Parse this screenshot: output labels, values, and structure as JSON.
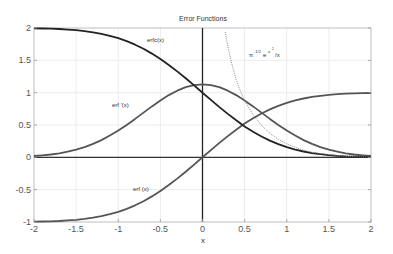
{
  "chart_data": {
    "type": "line",
    "title": "Error Functions",
    "xlabel": "x",
    "ylabel": "",
    "xlim": [
      -2,
      2
    ],
    "ylim": [
      -1,
      2
    ],
    "grid": true,
    "x_ticks": [
      "-2",
      "-1.5",
      "-1",
      "-0.5",
      "0",
      "0.5",
      "1",
      "1.5",
      "2"
    ],
    "x_tick_values": [
      -2,
      -1.5,
      -1,
      -0.5,
      0,
      0.5,
      1,
      1.5,
      2
    ],
    "y_ticks": [
      "-1",
      "-0.5",
      "0",
      "0.5",
      "1",
      "1.5",
      "2"
    ],
    "y_tick_values": [
      -1,
      -0.5,
      0,
      0.5,
      1,
      1.5,
      2
    ],
    "x": [
      -2,
      -1.9,
      -1.8,
      -1.7,
      -1.6,
      -1.5,
      -1.4,
      -1.3,
      -1.2,
      -1.1,
      -1,
      -0.9,
      -0.8,
      -0.7,
      -0.6,
      -0.5,
      -0.4,
      -0.3,
      -0.2,
      -0.1,
      0,
      0.1,
      0.2,
      0.3,
      0.4,
      0.5,
      0.6,
      0.7,
      0.8,
      0.9,
      1,
      1.1,
      1.2,
      1.3,
      1.4,
      1.5,
      1.6,
      1.7,
      1.8,
      1.9,
      2
    ],
    "series": [
      {
        "name": "erf (x)",
        "color": "#555555",
        "style": "solid",
        "values": [
          -0.995,
          -0.993,
          -0.989,
          -0.984,
          -0.976,
          -0.966,
          -0.952,
          -0.934,
          -0.91,
          -0.88,
          -0.843,
          -0.797,
          -0.742,
          -0.678,
          -0.604,
          -0.521,
          -0.428,
          -0.329,
          -0.223,
          -0.112,
          0,
          0.112,
          0.223,
          0.329,
          0.428,
          0.521,
          0.604,
          0.678,
          0.742,
          0.797,
          0.843,
          0.88,
          0.91,
          0.934,
          0.952,
          0.966,
          0.976,
          0.984,
          0.989,
          0.993,
          0.995
        ]
      },
      {
        "name": "erf '(x)",
        "color": "#555555",
        "style": "solid",
        "values": [
          0.021,
          0.031,
          0.044,
          0.063,
          0.087,
          0.119,
          0.159,
          0.208,
          0.267,
          0.337,
          0.415,
          0.502,
          0.595,
          0.691,
          0.787,
          0.879,
          0.962,
          1.031,
          1.084,
          1.117,
          1.128,
          1.117,
          1.084,
          1.031,
          0.962,
          0.879,
          0.787,
          0.691,
          0.595,
          0.502,
          0.415,
          0.337,
          0.267,
          0.208,
          0.159,
          0.119,
          0.087,
          0.063,
          0.044,
          0.031,
          0.021
        ]
      },
      {
        "name": "erfc(x)",
        "color": "#222222",
        "style": "solid",
        "values": [
          1.995,
          1.993,
          1.989,
          1.984,
          1.976,
          1.966,
          1.952,
          1.934,
          1.91,
          1.88,
          1.843,
          1.797,
          1.742,
          1.678,
          1.604,
          1.521,
          1.428,
          1.329,
          1.223,
          1.112,
          1,
          0.888,
          0.777,
          0.671,
          0.572,
          0.479,
          0.396,
          0.322,
          0.258,
          0.203,
          0.157,
          0.12,
          0.09,
          0.066,
          0.048,
          0.034,
          0.024,
          0.016,
          0.011,
          0.007,
          0.005
        ]
      },
      {
        "name": "π^-1/2 e^-x² /x",
        "color": "#888888",
        "style": "dotted",
        "x": [
          0.27,
          0.3,
          0.35,
          0.4,
          0.45,
          0.5,
          0.6,
          0.7,
          0.8,
          0.9,
          1,
          1.1,
          1.2,
          1.3,
          1.4,
          1.5,
          1.6,
          1.7,
          1.8,
          1.9,
          2
        ],
        "values": [
          1.94,
          1.718,
          1.432,
          1.202,
          1.024,
          0.879,
          0.656,
          0.494,
          0.372,
          0.279,
          0.208,
          0.153,
          0.111,
          0.08,
          0.057,
          0.04,
          0.027,
          0.018,
          0.012,
          0.008,
          0.005
        ]
      }
    ],
    "annotations": [
      {
        "text": "erfc(x)",
        "x": -0.45,
        "y": 1.85
      },
      {
        "text": "erf '(x)",
        "x": -0.77,
        "y": 0.83
      },
      {
        "text": "erf (x)",
        "x": -0.6,
        "y": -0.6
      },
      {
        "text": "π-1/2e-x²/x",
        "x": 0.85,
        "y": 1.65
      }
    ]
  },
  "labels": {
    "title": "Error Functions",
    "xlabel": "x",
    "annot_erfc": "erfc(x)",
    "annot_erfprime": "erf '(x)",
    "annot_erf": "erf (x)",
    "annot_asym_base1": "π",
    "annot_asym_exp1": "-1/2",
    "annot_asym_base2": "e",
    "annot_asym_exp2": "-x",
    "annot_asym_exp2b": "2",
    "annot_asym_tail": "/x"
  }
}
